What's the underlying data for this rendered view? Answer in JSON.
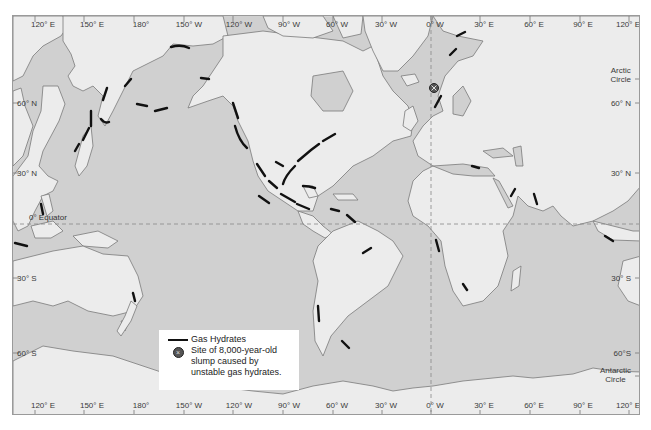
{
  "map": {
    "title": "Global distribution of gas hydrates",
    "colors": {
      "ocean": "#d0d0d0",
      "land": "#ececec",
      "coastline": "#7a7a7a",
      "hydrate": "#111111",
      "gridline": "#888888",
      "frame": "#9a9a9a"
    },
    "longitude_labels_top": [
      "120° E",
      "150° E",
      "180°",
      "150° W",
      "120° W",
      "90° W",
      "60° W",
      "30° W",
      "0° W",
      "30° E",
      "60° E",
      "90° E",
      "120° E"
    ],
    "longitude_labels_bottom": [
      "120° E",
      "150° E",
      "180°",
      "150° W",
      "120° W",
      "90° W",
      "60° W",
      "30° W",
      "0° W",
      "30° E",
      "60° E",
      "90° E",
      "120° E"
    ],
    "latitude_labels_left": [
      "60° N",
      "30° N",
      "30° S",
      "60° S"
    ],
    "latitude_labels_right": [
      "60° N",
      "30° N",
      "30° S",
      "60°S"
    ],
    "arctic_circle": {
      "line1": "Arctic",
      "line2": "Circle"
    },
    "antarctic_circle": {
      "line1": "Antarctic",
      "line2": "Circle"
    },
    "equator_label": "0° Equator",
    "prime_meridian_label": "0° W"
  },
  "legend": {
    "items": [
      {
        "symbol": "line",
        "label": "Gas Hydrates"
      },
      {
        "symbol": "circle-x",
        "label_line1": "Site of 8,000-year-old",
        "label_line2": "slump caused by",
        "label_line3": "unstable gas hydrates."
      }
    ]
  }
}
